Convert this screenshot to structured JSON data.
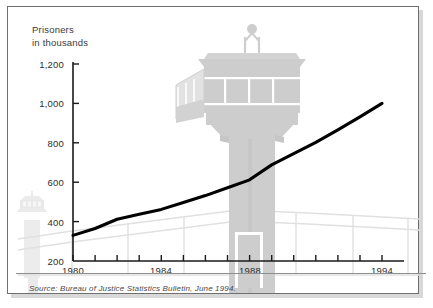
{
  "figure": {
    "axis_title_line1": "Prisoners",
    "axis_title_line2": "in thousands",
    "source_note": "Source: Bureau of Justice Statistics Bulletin, June 1994.",
    "background_watermark": "prison-guard-tower-illustration",
    "colors": {
      "line": "#000000",
      "axis": "#1a1a1a",
      "text": "#2e2e2e",
      "watermark": "#d9d9d9",
      "frame": "#6f6f6f",
      "page": "#ffffff"
    }
  },
  "chart_data": {
    "type": "line",
    "title": "",
    "subtitle": "",
    "xlabel": "",
    "ylabel": "Prisoners in thousands",
    "xlim": [
      1979.5,
      1994.5
    ],
    "ylim": [
      200,
      1200
    ],
    "grid": false,
    "legend": null,
    "y_ticks": [
      200,
      400,
      600,
      800,
      1000,
      1200
    ],
    "y_tick_labels": [
      "200",
      "400",
      "600",
      "800",
      "1,000",
      "1,200"
    ],
    "x_ticks": [
      1980,
      1981,
      1982,
      1983,
      1984,
      1985,
      1986,
      1987,
      1988,
      1989,
      1990,
      1991,
      1992,
      1993,
      1994
    ],
    "x_tick_labels_shown": [
      "1980",
      "1984",
      "1988",
      "1994"
    ],
    "x_labeled_ticks": [
      1980,
      1984,
      1988,
      1994
    ],
    "x": [
      1980,
      1981,
      1982,
      1983,
      1984,
      1985,
      1986,
      1987,
      1988,
      1989,
      1990,
      1991,
      1992,
      1993,
      1994
    ],
    "values": [
      330,
      365,
      412,
      437,
      462,
      497,
      532,
      572,
      612,
      688,
      745,
      802,
      866,
      932,
      1000
    ],
    "series": [
      {
        "name": "Prisoners in thousands",
        "values": [
          330,
          365,
          412,
          437,
          462,
          497,
          532,
          572,
          612,
          688,
          745,
          802,
          866,
          932,
          1000
        ]
      }
    ],
    "units": "thousands"
  }
}
